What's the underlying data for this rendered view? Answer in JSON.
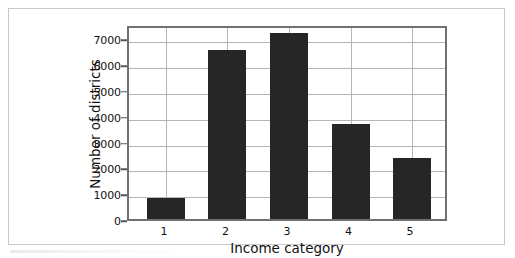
{
  "figure": {
    "xlabel": "Income category",
    "ylabel": "Number of districts",
    "bar_color": "#262626",
    "grid_color": "#b5b5b5",
    "frame_color": "#707070",
    "background": "#ffffff"
  },
  "chart_data": {
    "type": "bar",
    "title": "",
    "xlabel": "Income category",
    "ylabel": "Number of districts",
    "categories": [
      "1",
      "2",
      "3",
      "4",
      "5"
    ],
    "values": [
      830,
      6560,
      7200,
      3670,
      2370
    ],
    "xtick_labels": [
      "1",
      "2",
      "3",
      "4",
      "5"
    ],
    "ytick_labels": [
      "0",
      "1000",
      "2000",
      "3000",
      "4000",
      "5000",
      "6000",
      "7000"
    ],
    "ytick_values": [
      0,
      1000,
      2000,
      3000,
      4000,
      5000,
      6000,
      7000
    ],
    "ylim": [
      0,
      7550
    ],
    "xlim": [
      0.4,
      5.6
    ],
    "grid": "horizontal-and-vertical",
    "legend": "none",
    "bar_color": "#262626",
    "series": [
      {
        "name": "Number of districts",
        "values": [
          830,
          6560,
          7200,
          3670,
          2370
        ]
      }
    ]
  }
}
